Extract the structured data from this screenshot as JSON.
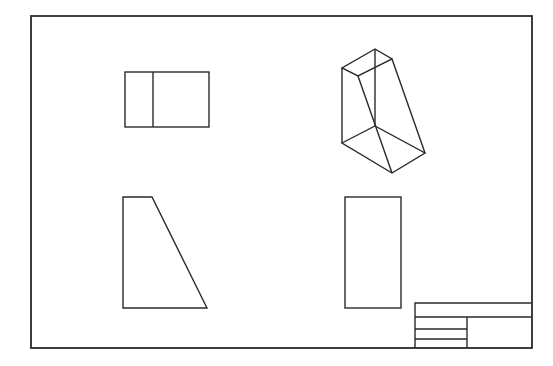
{
  "drawing": {
    "title": "",
    "background": "#ffffff",
    "line_color": "#2a2a2a",
    "border": {
      "x1": 31,
      "y1": 16,
      "x2": 532,
      "y2": 348
    },
    "views": {
      "top_view": {
        "label": "Top view",
        "rect": {
          "x": 125,
          "y": 72,
          "w": 84,
          "h": 55
        },
        "divider_x": 153
      },
      "isometric_view": {
        "label": "Isometric view",
        "points": {
          "A": [
            375,
            49
          ],
          "B": [
            342,
            68
          ],
          "C": [
            358,
            76
          ],
          "D": [
            392,
            59
          ],
          "E": [
            375,
            126
          ],
          "F": [
            342,
            143
          ],
          "G": [
            392,
            173
          ],
          "H": [
            425,
            153
          ]
        }
      },
      "front_view": {
        "label": "Front view",
        "polygon": [
          [
            123,
            197
          ],
          [
            152,
            197
          ],
          [
            207,
            308
          ],
          [
            123,
            308
          ]
        ]
      },
      "side_view": {
        "label": "Side view",
        "rect": {
          "x": 345,
          "y": 197,
          "w": 56,
          "h": 111
        }
      }
    },
    "title_block": {
      "x1": 415,
      "y1": 303,
      "x2": 531,
      "y2": 348,
      "row_line_y": 317,
      "split_x": 467,
      "left_rows_y": [
        329,
        339
      ],
      "cells": []
    }
  }
}
